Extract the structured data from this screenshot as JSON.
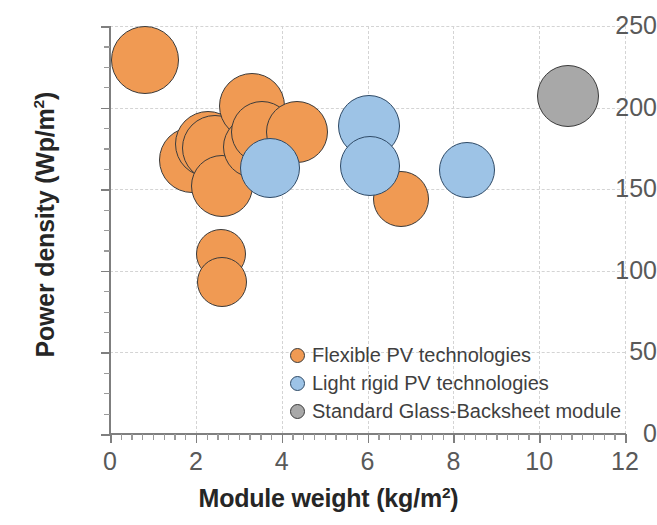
{
  "chart_data": {
    "type": "scatter",
    "title": "",
    "xlabel": "Module weight (kg/m²)",
    "ylabel": "Power density (Wp/m²)",
    "xlim": [
      0,
      12
    ],
    "ylim": [
      0,
      250
    ],
    "xticks": [
      0,
      2,
      4,
      6,
      8,
      10,
      12
    ],
    "yticks": [
      0,
      50,
      100,
      150,
      200,
      250
    ],
    "xtick_labels": [
      "0",
      "2",
      "4",
      "6",
      "8",
      "10",
      "12"
    ],
    "ytick_labels": [
      "0",
      "50",
      "100",
      "150",
      "200",
      "250"
    ],
    "x_minor_interval": 0.25,
    "y_minor_interval": 12.5,
    "grid": "dashed light-grey major gridlines",
    "legend_position": "inside lower-right",
    "series": [
      {
        "name": "Flexible PV technologies",
        "color": "#f09a53",
        "edge_color": "#3b3b3b",
        "points": [
          {
            "x": 0.82,
            "y": 229,
            "r": 34
          },
          {
            "x": 1.92,
            "y": 168,
            "r": 33
          },
          {
            "x": 2.28,
            "y": 178,
            "r": 33
          },
          {
            "x": 2.45,
            "y": 175,
            "r": 33
          },
          {
            "x": 2.62,
            "y": 152,
            "r": 31
          },
          {
            "x": 3.32,
            "y": 201,
            "r": 33
          },
          {
            "x": 3.35,
            "y": 176,
            "r": 31
          },
          {
            "x": 3.55,
            "y": 185,
            "r": 31
          },
          {
            "x": 4.35,
            "y": 185,
            "r": 31
          },
          {
            "x": 2.58,
            "y": 110,
            "r": 25
          },
          {
            "x": 2.62,
            "y": 93,
            "r": 25
          },
          {
            "x": 6.78,
            "y": 144,
            "r": 28
          }
        ]
      },
      {
        "name": "Light rigid PV technologies",
        "color": "#9dc3e6",
        "edge_color": "#2f4a66",
        "points": [
          {
            "x": 3.72,
            "y": 163,
            "r": 30
          },
          {
            "x": 6.03,
            "y": 189,
            "r": 31
          },
          {
            "x": 6.05,
            "y": 164,
            "r": 30
          },
          {
            "x": 8.33,
            "y": 162,
            "r": 28
          }
        ]
      },
      {
        "name": "Standard Glass-Backsheet module",
        "color": "#a8a8a8",
        "edge_color": "#3b3b3b",
        "points": [
          {
            "x": 10.68,
            "y": 207,
            "r": 31
          }
        ]
      }
    ]
  },
  "axes": {
    "x_title": "Module weight (kg/m",
    "x_title_sup": "2",
    "x_title_tail": ")",
    "y_title": "Power density (Wp/m",
    "y_title_sup": "2",
    "y_title_tail": ")"
  },
  "legend": {
    "items": [
      {
        "label": "Flexible PV technologies",
        "color": "#f09a53"
      },
      {
        "label": "Light rigid PV technologies",
        "color": "#9dc3e6"
      },
      {
        "label": "Standard Glass-Backsheet module",
        "color": "#a8a8a8"
      }
    ]
  }
}
